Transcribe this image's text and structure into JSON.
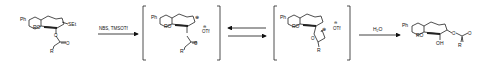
{
  "scheme": {
    "type": "reaction-scheme",
    "steps": [
      {
        "reagents": "NBS, TMSOTf",
        "arrow": "forward"
      },
      {
        "arrow": "equilibrium"
      },
      {
        "reagents": "H2O",
        "reagents_display": "H₂O",
        "arrow": "forward"
      }
    ],
    "structures": [
      {
        "id": "starting-material",
        "labels": {
          "ph": "Ph",
          "ro": "RO",
          "sub": "SEt",
          "carbonyl_o": "O",
          "r": "R",
          "ring_o": "O"
        }
      },
      {
        "id": "oxocarbenium-intermediate",
        "bracketed": true,
        "labels": {
          "ph": "Ph",
          "ro": "RO",
          "charge": "⊕",
          "counterion_charge": "⊖",
          "counterion": "OTf",
          "carbonyl_o": "O",
          "r": "R"
        }
      },
      {
        "id": "dioxolenium-intermediate",
        "bracketed": true,
        "labels": {
          "ph": "Ph",
          "ro": "RO",
          "charge": "⊕",
          "counterion_charge": "⊖",
          "counterion": "OTf",
          "ring_o": "O",
          "r": "R"
        }
      },
      {
        "id": "product",
        "labels": {
          "ph": "Ph",
          "ro": "RO",
          "oh": "OH",
          "ester_o": "O",
          "carbonyl_o": "O",
          "r": "R"
        }
      }
    ]
  }
}
